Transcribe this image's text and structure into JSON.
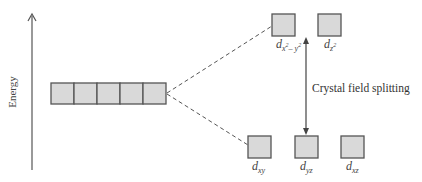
{
  "axis": {
    "label": "Energy"
  },
  "degenerate_set": {
    "orbital_count": 5
  },
  "upper_level": {
    "orbitals": [
      {
        "main": "d",
        "sub": "x",
        "sup": "2",
        "sub2": "– y",
        "sup2": "2"
      },
      {
        "main": "d",
        "sub": "z",
        "sup": "2"
      }
    ]
  },
  "lower_level": {
    "orbitals": [
      {
        "main": "d",
        "sub": "xy"
      },
      {
        "main": "d",
        "sub": "yz"
      },
      {
        "main": "d",
        "sub": "xz"
      }
    ]
  },
  "annotation": {
    "splitting_label": "Crystal field splitting"
  },
  "colors": {
    "box_fill": "#d9d9d9",
    "box_stroke": "#555555",
    "line": "#555555"
  }
}
